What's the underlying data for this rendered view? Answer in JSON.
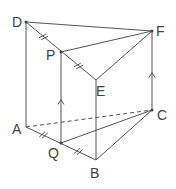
{
  "diagram": {
    "labels": {
      "A": "A",
      "B": "B",
      "C": "C",
      "D": "D",
      "E": "E",
      "F": "F",
      "P": "P",
      "Q": "Q"
    },
    "edges_solid": [
      "DA",
      "DF",
      "DE",
      "EF",
      "FC",
      "EB",
      "AB",
      "BC",
      "PF",
      "PQ",
      "QC"
    ],
    "edges_dashed": [
      "AC"
    ],
    "equal_marks": [
      "DP",
      "PE",
      "AQ",
      "QB"
    ],
    "parallel_arrows": [
      "PQ",
      "FC"
    ]
  }
}
